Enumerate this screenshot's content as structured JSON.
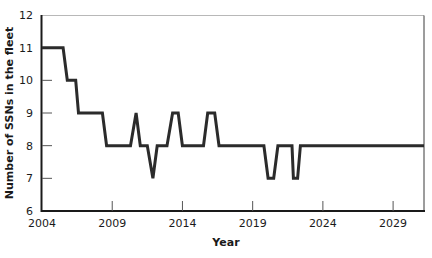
{
  "chart_data": {
    "type": "line",
    "title": "",
    "xlabel": "Year",
    "ylabel": "Number of SSNs in the fleet",
    "xlim": [
      2004,
      2031.2
    ],
    "ylim": [
      6,
      12
    ],
    "x_ticks": [
      2004,
      2009,
      2014,
      2019,
      2024,
      2029
    ],
    "y_ticks": [
      6,
      7,
      8,
      9,
      10,
      11,
      12
    ],
    "grid": false,
    "legend": null,
    "series": [
      {
        "name": "SSNs in the fleet",
        "color": "#2b2b2b",
        "x": [
          2004,
          2005.5,
          2005.8,
          2006.4,
          2006.6,
          2008.3,
          2008.6,
          2010.3,
          2010.7,
          2011.0,
          2011.5,
          2011.9,
          2012.2,
          2012.9,
          2013.3,
          2013.7,
          2014.0,
          2015.5,
          2015.8,
          2016.3,
          2016.6,
          2019.8,
          2020.1,
          2020.5,
          2020.8,
          2021.8,
          2021.9,
          2022.2,
          2022.4,
          2031.2
        ],
        "y": [
          11,
          11,
          10,
          10,
          9,
          9,
          8,
          8,
          9,
          8,
          8,
          7,
          8,
          8,
          9,
          9,
          8,
          8,
          9,
          9,
          8,
          8,
          7,
          7,
          8,
          8,
          7,
          7,
          8,
          8
        ]
      }
    ]
  }
}
